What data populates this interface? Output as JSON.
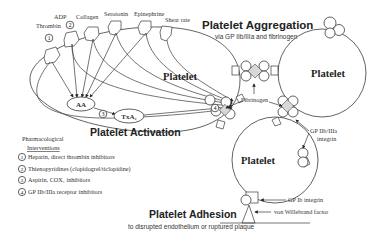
{
  "diagram": {
    "titles": {
      "aggregation": "Platelet Aggregation",
      "aggregation_sub": "via GP IIb/IIIa and fibrinogen",
      "activation": "Platelet Activation",
      "adhesion": "Platelet Adhesion",
      "adhesion_sub": "to disrupted endothelium or ruptured plaque"
    },
    "platelets": {
      "left": "Platelet",
      "right": "Platelet",
      "bottom": "Platelet"
    },
    "agonists": [
      "Thrombin",
      "ADP",
      "Collagen",
      "Serotonin",
      "Epinephrine",
      "Shear rate"
    ],
    "intermediates": {
      "aa": "AA",
      "txa2": "TxA₂"
    },
    "markers": {
      "m1": "1",
      "m2": "2",
      "m3": "3",
      "m4": "4"
    },
    "annotations": {
      "fibrinogen": "Fibrinogen",
      "gp2b3a_line1": "GP IIb/IIIa",
      "gp2b3a_line2": "integrin",
      "gp1b": "GP Ib integrin",
      "vwf": "von Willebrand factor"
    },
    "legend": {
      "title_line1": "Pharmacological",
      "title_line2": "Interventions",
      "items": [
        {
          "num": "1",
          "text": "Heparin, direct thrombin inhibitors"
        },
        {
          "num": "2",
          "text": "Thienopyridines (clopidogrel/ticlopidine)"
        },
        {
          "num": "3",
          "text": "Aspirin, COX₁ inhibitors"
        },
        {
          "num": "4",
          "text": "GP IIb/IIIa receptor inhibitors"
        }
      ]
    },
    "colors": {
      "line": "#3a3a3a",
      "fibrinogen_fill": "#d8d8d8",
      "background": "#ffffff"
    }
  }
}
